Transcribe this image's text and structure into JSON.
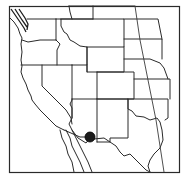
{
  "map": {
    "title": "Western United States",
    "region": "Western and Central US states",
    "marker": {
      "label": "Location marker",
      "approx_location": "Southwestern New Mexico / southeastern Arizona near US-Mexico border",
      "cx": 90,
      "cy": 137,
      "r": 5,
      "color": "#1c1c1c"
    },
    "colors": {
      "background": "#ffffff",
      "borders": "#2a2a2a"
    }
  }
}
